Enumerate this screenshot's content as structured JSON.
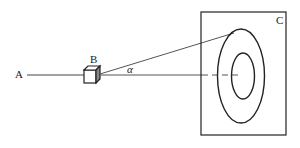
{
  "diagram": {
    "labels": {
      "a": "A",
      "b": "B",
      "c": "C",
      "angle": "α"
    },
    "colors": {
      "stroke": "#333333",
      "background": "#ffffff"
    },
    "elements": {
      "point_a": "A",
      "source_box": "B",
      "screen": "C",
      "outer_ring": "outer ellipse",
      "inner_ring": "inner ellipse",
      "angle_between_rays": "α"
    }
  }
}
